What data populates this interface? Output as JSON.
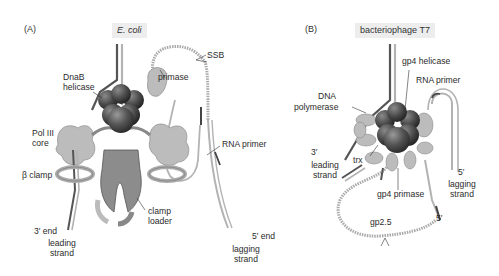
{
  "figure": {
    "panels": [
      {
        "letter": "(A)",
        "organism": "E. coli",
        "labels": {
          "ssb": "SSB",
          "dnab_1": "DnaB",
          "dnab_2": "helicase",
          "primase": "primase",
          "pol3_1": "Pol III",
          "pol3_2": "core",
          "beta_clamp": "β clamp",
          "rna_primer": "RNA primer",
          "clamp_loader_1": "clamp",
          "clamp_loader_2": "loader",
          "three_end": "3′ end",
          "leading_1": "leading",
          "leading_2": "strand",
          "five_end": "5′ end",
          "lagging_1": "lagging",
          "lagging_2": "strand"
        }
      },
      {
        "letter": "(B)",
        "organism": "bacteriophage T7",
        "labels": {
          "gp4_helicase": "gp4 helicase",
          "rna_primer": "RNA primer",
          "dna_pol_1": "DNA",
          "dna_pol_2": "polymerase",
          "three_prime": "3′",
          "leading_1": "leading",
          "leading_2": "strand",
          "trx": "trx",
          "gp4_primase": "gp4 primase",
          "five_prime_a": "5′",
          "lagging_1": "lagging",
          "lagging_2": "strand",
          "five_prime_b": "5′",
          "gp25": "gp2.5"
        }
      }
    ],
    "colors": {
      "dark_strand": "#555555",
      "light_strand": "#b3b3b3",
      "protein_light": "#bcbcbc",
      "protein_mid": "#8c8c8c",
      "helicase_dark": "#5a5a5a",
      "ssb_dotted": "#a8a8a8",
      "title_bg": "#ededed"
    }
  }
}
